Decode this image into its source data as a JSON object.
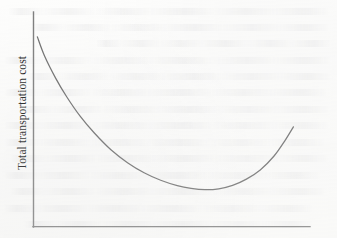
{
  "figure": {
    "background_color": "#fdfdfc",
    "line_color": "#7d7d7d",
    "curve_color": "#6e6e6e",
    "text_color": "#1c1c1c"
  },
  "axes": {
    "y_axis_label": "Total transportation cost",
    "x_axis_label": "",
    "y_tick_labels": [],
    "x_tick_labels": []
  },
  "chart_data": {
    "type": "line",
    "title": "",
    "subtitle": "",
    "xlabel": "",
    "ylabel": "Total transportation cost",
    "grid": false,
    "legend": [],
    "legend_position": "none",
    "xlim": [
      0,
      100
    ],
    "ylim": [
      0,
      100
    ],
    "x_tick_labels": [],
    "y_tick_labels": [],
    "annotations": [],
    "series": [
      {
        "name": "Total transportation cost",
        "x": [
          1.4,
          4,
          8,
          12,
          17,
          22,
          28,
          34,
          40,
          46,
          52,
          57,
          62,
          67,
          72,
          77,
          82,
          87,
          91,
          94
        ],
        "y": [
          88.4,
          79.5,
          69.2,
          60.5,
          51.2,
          43.6,
          35.8,
          29.8,
          25.1,
          21.6,
          19.1,
          17.8,
          17.2,
          17.6,
          19.2,
          22.1,
          26.4,
          32.9,
          40.2,
          46.5
        ]
      }
    ],
    "minimum_point": {
      "x": 62,
      "y": 17.2
    },
    "shape": "convex-u-curve"
  }
}
